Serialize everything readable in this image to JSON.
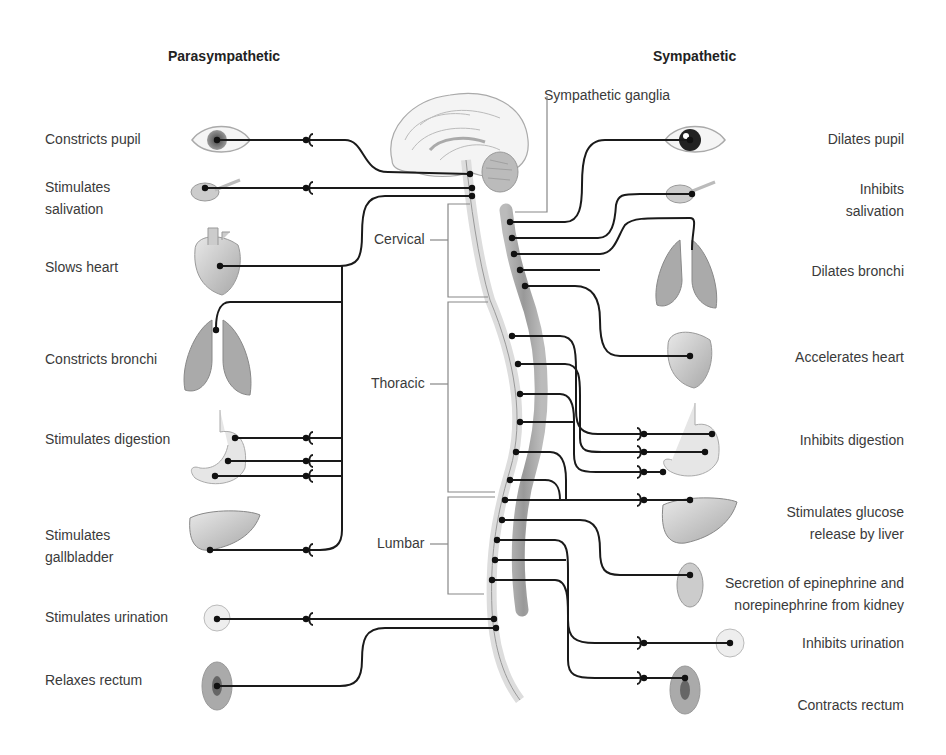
{
  "headers": {
    "parasympathetic": "Parasympathetic",
    "sympathetic": "Sympathetic"
  },
  "annotations": {
    "sympathetic_ganglia": "Sympathetic ganglia"
  },
  "spinal_segments": {
    "cervical": "Cervical",
    "thoracic": "Thoracic",
    "lumbar": "Lumbar"
  },
  "parasympathetic_effects": [
    {
      "label": "Constricts pupil",
      "organ": "eye-icon"
    },
    {
      "label": "Stimulates salivation",
      "organ": "salivary-gland-icon"
    },
    {
      "label": "Slows heart",
      "organ": "heart-icon"
    },
    {
      "label": "Constricts bronchi",
      "organ": "lungs-icon"
    },
    {
      "label": "Stimulates digestion",
      "organ": "stomach-icon"
    },
    {
      "label": "Stimulates gallbladder",
      "organ": "liver-icon"
    },
    {
      "label": "Stimulates urination",
      "organ": "bladder-icon"
    },
    {
      "label": "Relaxes rectum",
      "organ": "rectum-icon"
    }
  ],
  "sympathetic_effects": [
    {
      "label": "Dilates pupil",
      "organ": "eye-icon"
    },
    {
      "label": "Inhibits salivation",
      "organ": "salivary-gland-icon"
    },
    {
      "label": "Dilates bronchi",
      "organ": "lungs-icon"
    },
    {
      "label": "Accelerates heart",
      "organ": "heart-icon"
    },
    {
      "label": "Inhibits digestion",
      "organ": "stomach-icon"
    },
    {
      "label": "Stimulates glucose release by liver",
      "organ": "liver-icon"
    },
    {
      "label": "Secretion of epinephrine and norepinephrine from kidney",
      "organ": "kidney-icon"
    },
    {
      "label": "Inhibits urination",
      "organ": "bladder-icon"
    },
    {
      "label": "Contracts rectum",
      "organ": "rectum-icon"
    }
  ]
}
